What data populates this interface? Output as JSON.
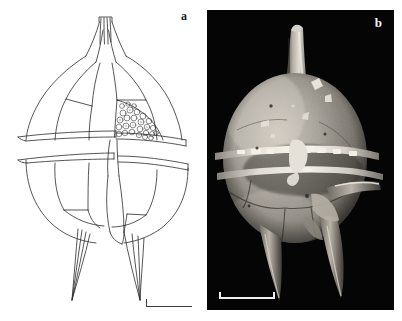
{
  "figure": {
    "caption_present": false,
    "background_color": "#ffffff",
    "width": 402,
    "height": 321,
    "panels": [
      {
        "id": "a",
        "label": "a",
        "type": "line-drawing",
        "background_color": "#ffffff",
        "ink_color": "#2b2b2b",
        "label_color": "#1a1a1a",
        "features": [
          "apical horn",
          "epitheca plates",
          "reticulate granular plate",
          "upper cingular list",
          "lower cingular list",
          "hypotheca plates",
          "antapical spines",
          "scale bar"
        ],
        "scale_bar": {
          "orientation": "horizontal",
          "has_left_tick": true,
          "has_right_tick": false,
          "color": "#3b3b3b",
          "length_px": 46
        }
      },
      {
        "id": "b",
        "label": "b",
        "type": "sem-micrograph",
        "background_color": "#050505",
        "label_color": "#f2f2f2",
        "cell_highlight_color": "#d9d4cb",
        "cell_midtone_color": "#8d8880",
        "cell_shadow_color": "#3a3732",
        "features": [
          "apical horn",
          "granulated thecal surface",
          "bright cingular lists",
          "lateral spine",
          "two antapical spines",
          "debris particles",
          "scale bar"
        ],
        "scale_bar": {
          "orientation": "horizontal",
          "has_left_tick": true,
          "has_right_tick": true,
          "color": "#efefef",
          "length_px": 56
        }
      }
    ]
  }
}
